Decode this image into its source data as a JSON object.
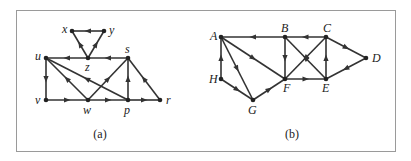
{
  "figure": {
    "panels": [
      {
        "caption": "(a)",
        "nodes": [
          {
            "id": "x",
            "label": "x",
            "x": 72,
            "y": 31,
            "lx": -10,
            "ly": 2
          },
          {
            "id": "y",
            "label": "y",
            "x": 104,
            "y": 31,
            "lx": 5,
            "ly": 3
          },
          {
            "id": "z",
            "label": "z",
            "x": 88,
            "y": 58,
            "lx": -3,
            "ly": 13
          },
          {
            "id": "u",
            "label": "u",
            "x": 46,
            "y": 58,
            "lx": -11,
            "ly": 2
          },
          {
            "id": "s",
            "label": "s",
            "x": 128,
            "y": 58,
            "lx": -3,
            "ly": -5
          },
          {
            "id": "v",
            "label": "v",
            "x": 46,
            "y": 100,
            "lx": -11,
            "ly": 4
          },
          {
            "id": "w",
            "label": "w",
            "x": 88,
            "y": 100,
            "lx": -5,
            "ly": 14
          },
          {
            "id": "p",
            "label": "p",
            "x": 128,
            "y": 100,
            "lx": -4,
            "ly": 14
          },
          {
            "id": "r",
            "label": "r",
            "x": 160,
            "y": 100,
            "lx": 6,
            "ly": 4
          }
        ],
        "edges": [
          {
            "from": "y",
            "to": "x"
          },
          {
            "from": "z",
            "to": "x"
          },
          {
            "from": "z",
            "to": "y"
          },
          {
            "from": "s",
            "to": "z"
          },
          {
            "from": "z",
            "to": "u"
          },
          {
            "from": "u",
            "to": "v"
          },
          {
            "from": "w",
            "to": "u"
          },
          {
            "from": "p",
            "to": "u"
          },
          {
            "from": "v",
            "to": "w"
          },
          {
            "from": "w",
            "to": "p"
          },
          {
            "from": "p",
            "to": "r"
          },
          {
            "from": "w",
            "to": "s"
          },
          {
            "from": "p",
            "to": "s"
          },
          {
            "from": "r",
            "to": "s"
          }
        ],
        "caption_pos": {
          "x": 100,
          "y": 138
        }
      },
      {
        "caption": "(b)",
        "nodes": [
          {
            "id": "A",
            "label": "A",
            "x": 221,
            "y": 37,
            "lx": -11,
            "ly": 3
          },
          {
            "id": "B",
            "label": "B",
            "x": 285,
            "y": 37,
            "lx": -4,
            "ly": -5
          },
          {
            "id": "C",
            "label": "C",
            "x": 326,
            "y": 37,
            "lx": -3,
            "ly": -5
          },
          {
            "id": "D",
            "label": "D",
            "x": 366,
            "y": 58,
            "lx": 6,
            "ly": 4
          },
          {
            "id": "H",
            "label": "H",
            "x": 221,
            "y": 79,
            "lx": -12,
            "ly": 4
          },
          {
            "id": "F",
            "label": "F",
            "x": 285,
            "y": 79,
            "lx": -2,
            "ly": 13
          },
          {
            "id": "E",
            "label": "E",
            "x": 326,
            "y": 79,
            "lx": -4,
            "ly": 13
          },
          {
            "id": "G",
            "label": "G",
            "x": 253,
            "y": 100,
            "lx": -5,
            "ly": 14
          }
        ],
        "edges": [
          {
            "from": "C",
            "to": "B"
          },
          {
            "from": "B",
            "to": "A"
          },
          {
            "from": "A",
            "to": "F"
          },
          {
            "from": "A",
            "to": "G"
          },
          {
            "from": "H",
            "to": "A"
          },
          {
            "from": "H",
            "to": "G"
          },
          {
            "from": "G",
            "to": "F"
          },
          {
            "from": "B",
            "to": "F"
          },
          {
            "from": "E",
            "to": "B"
          },
          {
            "from": "C",
            "to": "F"
          },
          {
            "from": "F",
            "to": "E"
          },
          {
            "from": "E",
            "to": "C"
          },
          {
            "from": "C",
            "to": "D"
          },
          {
            "from": "D",
            "to": "E"
          }
        ],
        "caption_pos": {
          "x": 292,
          "y": 138
        }
      }
    ]
  }
}
